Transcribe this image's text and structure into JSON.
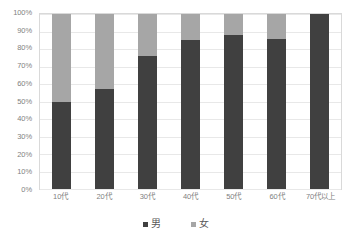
{
  "chart_data": {
    "type": "bar",
    "subtype": "100% stacked bar",
    "title": "",
    "subtitle": "",
    "xlabel": "",
    "ylabel": "",
    "ylim": [
      0,
      100
    ],
    "grid": true,
    "legend_position": "bottom",
    "categories": [
      "10代",
      "20代",
      "30代",
      "40代",
      "50代",
      "60代",
      "70代以上"
    ],
    "y_ticks": [
      "0%",
      "10%",
      "20%",
      "30%",
      "40%",
      "50%",
      "60%",
      "70%",
      "80%",
      "90%",
      "100%"
    ],
    "y_tick_values": [
      0,
      10,
      20,
      30,
      40,
      50,
      60,
      70,
      80,
      90,
      100
    ],
    "series": [
      {
        "name": "男",
        "color": "#404040",
        "values": [
          50,
          57,
          76,
          85,
          88,
          86,
          100
        ]
      },
      {
        "name": "女",
        "color": "#a6a6a6",
        "values": [
          50,
          43,
          24,
          15,
          12,
          14,
          0
        ]
      }
    ]
  },
  "legend": {
    "items": [
      {
        "label": "男",
        "color": "#404040"
      },
      {
        "label": "女",
        "color": "#a6a6a6"
      }
    ]
  },
  "colors": {
    "male": "#404040",
    "female": "#a6a6a6",
    "gridline": "#e8e8e8",
    "plot_border": "#d9d9d9",
    "axis_text": "#7f7f7f",
    "legend_text": "#595959",
    "background": "#ffffff"
  }
}
